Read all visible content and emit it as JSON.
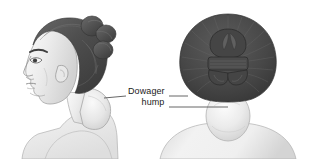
{
  "figure": {
    "type": "medical-illustration",
    "background_color": "#ffffff",
    "views": [
      {
        "id": "lateral",
        "label": "Lateral profile view of woman with dowager hump",
        "position": "left"
      },
      {
        "id": "posterior",
        "label": "Posterior view of woman with dowager hump",
        "position": "right"
      }
    ]
  },
  "callout": {
    "line1": "Dowager",
    "line2": "hump",
    "full_text": "Dowager hump",
    "text_color": "#1a1a1a",
    "leader_line_color": "#555555"
  },
  "palette": {
    "hair_dark": "#4f4f4f",
    "hair_darker": "#3c3c3c",
    "hair_highlight": "#6e6e6e",
    "skin_light": "#f2f2f2",
    "skin_shade": "#dcdcdc",
    "skin_deep_shade": "#c6c6c6",
    "outline": "#9a9a9a",
    "outline_soft": "#b4b4b4"
  }
}
